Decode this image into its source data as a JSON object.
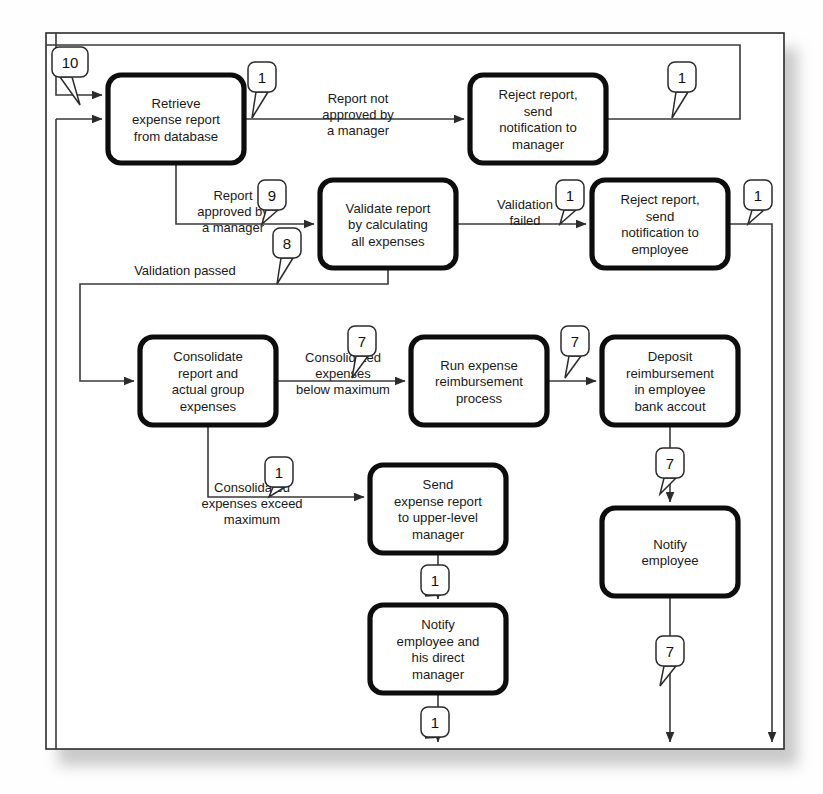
{
  "diagram": {
    "frame": {
      "x": 46,
      "y": 33,
      "width": 738,
      "height": 716
    },
    "colors": {
      "box_stroke": "#0d0d0d",
      "box_fill": "#ffffff",
      "connector": "#3a3a3a",
      "frame": "#2b2b2b",
      "text": "#1a1a1a",
      "page_background": "#ffffff",
      "shadow": "#bdbdbd"
    },
    "processes": [
      {
        "id": "retrieve",
        "lines": [
          "Retrieve",
          "expense report",
          "from database"
        ],
        "x": 108,
        "y": 75,
        "w": 136,
        "h": 88
      },
      {
        "id": "reject-mgr",
        "lines": [
          "Reject report,",
          "send",
          "notification to",
          "manager"
        ],
        "x": 470,
        "y": 75,
        "w": 136,
        "h": 88
      },
      {
        "id": "validate",
        "lines": [
          "Validate report",
          "by calculating",
          "all expenses"
        ],
        "x": 320,
        "y": 180,
        "w": 136,
        "h": 88
      },
      {
        "id": "reject-emp",
        "lines": [
          "Reject report,",
          "send",
          "notification to",
          "employee"
        ],
        "x": 592,
        "y": 180,
        "w": 136,
        "h": 88
      },
      {
        "id": "consolidate",
        "lines": [
          "Consolidate",
          "report and",
          "actual group",
          "expenses"
        ],
        "x": 140,
        "y": 337,
        "w": 136,
        "h": 88
      },
      {
        "id": "run-reimb",
        "lines": [
          "Run expense",
          "reimbursement",
          "process"
        ],
        "x": 411,
        "y": 337,
        "w": 136,
        "h": 88
      },
      {
        "id": "deposit",
        "lines": [
          "Deposit",
          "reimbursement",
          "in employee",
          "bank accout"
        ],
        "x": 602,
        "y": 337,
        "w": 136,
        "h": 88
      },
      {
        "id": "send-upper",
        "lines": [
          "Send",
          "expense report",
          "to upper-level",
          "manager"
        ],
        "x": 370,
        "y": 465,
        "w": 136,
        "h": 88
      },
      {
        "id": "notify-emp",
        "lines": [
          "Notify",
          "employee"
        ],
        "x": 602,
        "y": 508,
        "w": 136,
        "h": 88
      },
      {
        "id": "notify-both",
        "lines": [
          "Notify",
          "employee and",
          "his direct",
          "manager"
        ],
        "x": 370,
        "y": 605,
        "w": 136,
        "h": 88
      }
    ],
    "edge_labels": [
      {
        "id": "report-not-approved",
        "lines": [
          "Report not",
          "approved by",
          "a manager"
        ],
        "x": 358,
        "y": 103
      },
      {
        "id": "report-approved",
        "lines": [
          "Report",
          "approved by",
          "a manager"
        ],
        "x": 233,
        "y": 200
      },
      {
        "id": "validation-failed",
        "lines": [
          "Validation",
          "failed"
        ],
        "x": 525,
        "y": 209
      },
      {
        "id": "validation-passed",
        "lines": [
          "Validation passed"
        ],
        "x": 185,
        "y": 275
      },
      {
        "id": "consolidated-below",
        "lines": [
          "Consolidated",
          "expenses",
          "below maximum"
        ],
        "x": 343,
        "y": 362
      },
      {
        "id": "consolidated-exceed",
        "lines": [
          "Consolidated",
          "expenses exceed",
          "maximum"
        ],
        "x": 252,
        "y": 492
      }
    ],
    "callouts": [
      {
        "id": "c-10",
        "value": "10",
        "x": 52,
        "y": 47,
        "tail": [
          80,
          105
        ]
      },
      {
        "id": "c-1-top-left",
        "value": "1",
        "x": 248,
        "y": 62,
        "tail": [
          252,
          118
        ]
      },
      {
        "id": "c-1-top-right",
        "value": "1",
        "x": 668,
        "y": 62,
        "tail": [
          672,
          118
        ]
      },
      {
        "id": "c-9",
        "value": "9",
        "x": 258,
        "y": 180,
        "tail": [
          262,
          224
        ]
      },
      {
        "id": "c-1-valfail",
        "value": "1",
        "x": 556,
        "y": 180,
        "tail": [
          560,
          224
        ]
      },
      {
        "id": "c-1-rejemp-right",
        "value": "1",
        "x": 744,
        "y": 180,
        "tail": [
          748,
          224
        ]
      },
      {
        "id": "c-8",
        "value": "8",
        "x": 273,
        "y": 228,
        "tail": [
          277,
          284
        ]
      },
      {
        "id": "c-7-consol",
        "value": "7",
        "x": 348,
        "y": 326,
        "tail": [
          352,
          378
        ]
      },
      {
        "id": "c-7-runreimb",
        "value": "7",
        "x": 561,
        "y": 326,
        "tail": [
          565,
          378
        ]
      },
      {
        "id": "c-7-deposit",
        "value": "7",
        "x": 656,
        "y": 448,
        "tail": [
          660,
          494
        ]
      },
      {
        "id": "c-1-exceed",
        "value": "1",
        "x": 265,
        "y": 457,
        "tail": [
          269,
          497
        ]
      },
      {
        "id": "c-1-sendupper",
        "value": "1",
        "x": 421,
        "y": 565,
        "tail": [
          425,
          596
        ]
      },
      {
        "id": "c-7-notifyemp",
        "value": "7",
        "x": 656,
        "y": 636,
        "tail": [
          660,
          686
        ]
      },
      {
        "id": "c-1-notifyboth",
        "value": "1",
        "x": 421,
        "y": 707,
        "tail": [
          425,
          738
        ]
      }
    ]
  }
}
